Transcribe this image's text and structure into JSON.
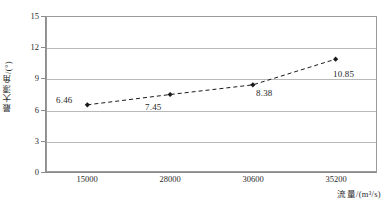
{
  "chart_data": {
    "type": "line",
    "title": "",
    "subtitle": "",
    "xlabel": "流量/(m³/s)",
    "ylabel": "最大漂角/(°)",
    "categories": [
      "15000",
      "28000",
      "30600",
      "35200"
    ],
    "values": [
      6.46,
      7.45,
      8.38,
      10.85
    ],
    "point_labels": [
      "6.46",
      "7.45",
      "8.38",
      "10.85"
    ],
    "yticks": [
      "0",
      "3",
      "6",
      "9",
      "12",
      "15"
    ],
    "ylim": [
      0,
      15
    ],
    "grid": "horizontal",
    "legend": "none",
    "line_style": "dashed",
    "marker": "diamond",
    "series_color": "#1a1a1a",
    "grid_color": "#b9b9b9",
    "frame_color": "#9a9a9a",
    "background": "#ffffff"
  }
}
